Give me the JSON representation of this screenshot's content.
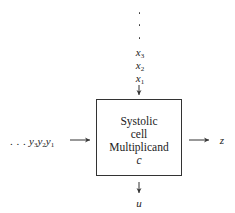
{
  "diagram": {
    "cell": {
      "line1": "Systolic",
      "line2": "cell",
      "line3": "Multiplicand",
      "line4": "c"
    },
    "top_input": {
      "ellipsis": [
        "·",
        "·",
        "·"
      ],
      "items": [
        {
          "base": "x",
          "sub": "3"
        },
        {
          "base": "x",
          "sub": "2"
        },
        {
          "base": "x",
          "sub": "1"
        }
      ]
    },
    "left_input": {
      "ellipsis": ". . .",
      "items": [
        {
          "base": "y",
          "sub": "3"
        },
        {
          "base": "y",
          "sub": "2"
        },
        {
          "base": "y",
          "sub": "1"
        }
      ]
    },
    "right_output": {
      "label": "z"
    },
    "bottom_output": {
      "label": "u"
    }
  }
}
